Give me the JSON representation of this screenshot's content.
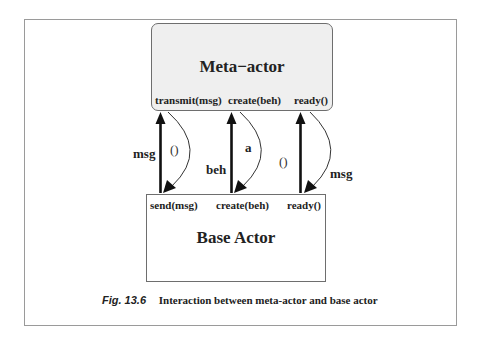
{
  "meta_actor": {
    "title": "Meta−actor",
    "methods": [
      "transmit(msg)",
      "create(beh)",
      "ready()"
    ]
  },
  "base_actor": {
    "title": "Base Actor",
    "methods": [
      "send(msg)",
      "create(beh)",
      "ready()"
    ]
  },
  "flows": [
    {
      "up_label": "msg",
      "down_label": "()"
    },
    {
      "up_label": "beh",
      "down_label": "a"
    },
    {
      "up_label": "()",
      "down_label": "msg"
    }
  ],
  "caption": {
    "figure": "Fig. 13.6",
    "text": "Interaction between meta-actor and base actor"
  },
  "colors": {
    "meta_fill": "#efefef",
    "border": "#6e6e6e",
    "frame": "#9a9a9a",
    "arrow": "#111111"
  }
}
